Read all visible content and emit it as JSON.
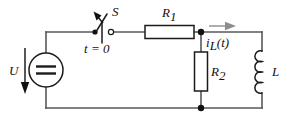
{
  "figure": {
    "type": "circuit-diagram",
    "background_color": "#ffffff",
    "wire_color": "#58585a",
    "component_color": "#1b1b1b",
    "current_arrow_color": "#8d8d8f"
  },
  "labels": {
    "source_voltage": "U",
    "switch_name": "S",
    "switch_time_var": "t",
    "switch_time_eq": " = 0",
    "switch_time_full": "t = 0",
    "resistor1_name": "R",
    "resistor1_sub": "1",
    "resistor2_name": "R",
    "resistor2_sub": "2",
    "inductor_name": "L",
    "current_name": "i",
    "current_sub": "L",
    "current_arg": "(t)",
    "current_full": "i_L(t)"
  },
  "components": {
    "source": {
      "name": "DC voltage source",
      "symbol": "circle-with-double-line",
      "label": "U",
      "polarity_arrow": "down"
    },
    "switch": {
      "name": "Switch S",
      "state": "open",
      "closes_at": "t = 0",
      "label": "S"
    },
    "resistor1": {
      "name": "Resistor R1",
      "orientation": "horizontal",
      "label": "R1"
    },
    "resistor2": {
      "name": "Resistor R2",
      "orientation": "vertical",
      "label": "R2"
    },
    "inductor": {
      "name": "Inductor L",
      "orientation": "vertical",
      "coil_turns": 4,
      "label": "L"
    },
    "current": {
      "name": "Inductor branch current",
      "label": "i_L(t)",
      "direction": "right"
    }
  }
}
